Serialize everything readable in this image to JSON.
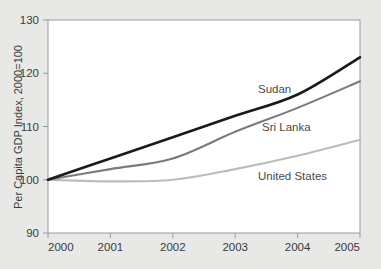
{
  "chart_data": {
    "type": "line",
    "title": "",
    "subtitle": "",
    "xlabel": "",
    "ylabel": "Per Capita GDP Index, 2000=100",
    "x": [
      2000,
      2001,
      2002,
      2003,
      2004,
      2005
    ],
    "xtick_labels": [
      "2000",
      "2001",
      "2002",
      "2003",
      "2004",
      "2005"
    ],
    "ytick_labels": [
      "90",
      "100",
      "110",
      "120",
      "130"
    ],
    "ytick_values": [
      90,
      100,
      110,
      120,
      130
    ],
    "xlim": [
      2000,
      2005
    ],
    "ylim": [
      90,
      130
    ],
    "grid": false,
    "legend_position": "inline-annotations",
    "series": [
      {
        "name": "Sudan",
        "label": "Sudan",
        "color": "#1a1a1a",
        "width": 2.6,
        "values": [
          100,
          104,
          108,
          112,
          116,
          123
        ]
      },
      {
        "name": "Sri Lanka",
        "label": "Sri Lanka",
        "color": "#7a7a7a",
        "width": 2.1,
        "values": [
          100,
          102,
          104,
          109,
          113.5,
          118.5
        ]
      },
      {
        "name": "United States",
        "label": "United States",
        "color": "#bcbcbc",
        "width": 2.1,
        "values": [
          100,
          99.7,
          100,
          102,
          104.5,
          107.5
        ]
      }
    ],
    "annotations": [
      {
        "text": "Sudan",
        "x": 258,
        "y": 93
      },
      {
        "text": "Sri Lanka",
        "x": 262,
        "y": 131
      },
      {
        "text": "United States",
        "x": 258,
        "y": 180
      }
    ]
  },
  "colors": {
    "background": "#e8e8e6",
    "plot_background": "#ffffff",
    "axis": "#9a9a9a",
    "tick_text": "#3b3b3b",
    "annotation_text": "#4a4a4a"
  },
  "geometry": {
    "plot_left": 48,
    "plot_right": 360,
    "plot_top": 20,
    "plot_bottom": 233
  }
}
